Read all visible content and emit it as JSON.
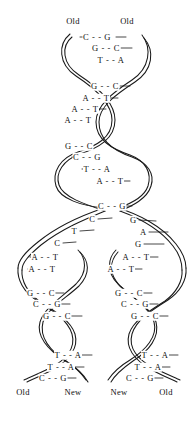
{
  "figure": {
    "stroke_color": "#1a1a1a",
    "text_color": "#101010",
    "background": "#ffffff"
  },
  "top_labels": [
    {
      "text": "Old",
      "x": 73,
      "y": 21
    },
    {
      "text": "Old",
      "x": 127,
      "y": 21
    }
  ],
  "bottom_labels": [
    {
      "text": "Old",
      "x": 23,
      "y": 392
    },
    {
      "text": "New",
      "x": 73,
      "y": 392
    },
    {
      "text": "New",
      "x": 119,
      "y": 392
    },
    {
      "text": "Old",
      "x": 166,
      "y": 392
    }
  ],
  "parent_pairs": [
    {
      "text": "C - - G",
      "x": 97,
      "y": 37
    },
    {
      "text": "G - - C",
      "x": 106,
      "y": 48
    },
    {
      "text": "T - - A",
      "x": 111,
      "y": 60
    },
    {
      "text": "G - - C",
      "x": 105,
      "y": 86
    },
    {
      "text": "A - - T",
      "x": 96,
      "y": 98
    },
    {
      "text": "A - - T",
      "x": 85,
      "y": 109
    },
    {
      "text": "A - - T",
      "x": 78,
      "y": 120
    },
    {
      "text": "G - - C",
      "x": 79,
      "y": 146
    },
    {
      "text": "C - - G",
      "x": 87,
      "y": 157
    },
    {
      "text": "T - - A",
      "x": 97,
      "y": 169
    },
    {
      "text": "A - - T",
      "x": 110,
      "y": 181
    },
    {
      "text": "C - - G",
      "x": 112,
      "y": 206
    }
  ],
  "unpaired_bases_left": [
    {
      "text": "C",
      "x": 92,
      "y": 219
    },
    {
      "text": "T",
      "x": 74,
      "y": 231
    },
    {
      "text": "C",
      "x": 57,
      "y": 243
    }
  ],
  "unpaired_bases_right": [
    {
      "text": "G",
      "x": 133,
      "y": 220
    },
    {
      "text": "A",
      "x": 143,
      "y": 232
    },
    {
      "text": "G",
      "x": 138,
      "y": 244
    }
  ],
  "left_daughter_pairs": [
    {
      "text": "A - - T",
      "x": 45,
      "y": 257
    },
    {
      "text": "A - - T",
      "x": 42,
      "y": 269
    },
    {
      "text": "G - - C",
      "x": 41,
      "y": 293
    },
    {
      "text": "C - - G",
      "x": 47,
      "y": 304
    },
    {
      "text": "G - - C",
      "x": 57,
      "y": 316
    },
    {
      "text": "T - - A",
      "x": 68,
      "y": 355
    },
    {
      "text": "T - - A",
      "x": 61,
      "y": 367
    },
    {
      "text": "C - - G",
      "x": 53,
      "y": 378
    }
  ],
  "right_daughter_pairs": [
    {
      "text": "A - - T",
      "x": 136,
      "y": 257
    },
    {
      "text": "A - - T",
      "x": 121,
      "y": 269
    },
    {
      "text": "G - - C",
      "x": 129,
      "y": 293
    },
    {
      "text": "C - - G",
      "x": 135,
      "y": 304
    },
    {
      "text": "G - - C",
      "x": 145,
      "y": 316
    },
    {
      "text": "T - - A",
      "x": 155,
      "y": 355
    },
    {
      "text": "T - - A",
      "x": 148,
      "y": 367
    },
    {
      "text": "C - - G",
      "x": 140,
      "y": 378
    }
  ]
}
